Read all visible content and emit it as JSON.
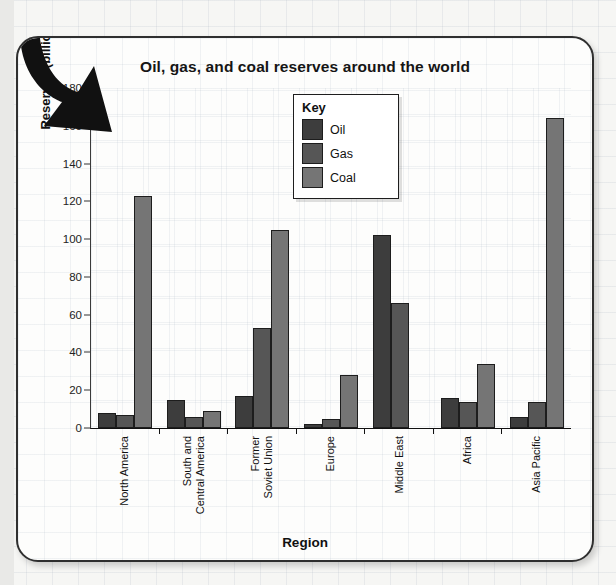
{
  "chart_data": {
    "type": "bar",
    "title": "Oil, gas, and coal reserves around the world",
    "xlabel": "Region",
    "ylabel": "Reserves (billions of tons of oil)",
    "ylim": [
      0,
      180
    ],
    "yticks": [
      0,
      20,
      40,
      60,
      80,
      100,
      120,
      140,
      160,
      180
    ],
    "grid": true,
    "legend_title": "Key",
    "legend_position": "inside-top-center",
    "categories": [
      "North America",
      "South and Central America",
      "Former Soviet Union",
      "Europe",
      "Middle East",
      "Africa",
      "Asia Pacific"
    ],
    "category_lines": [
      [
        "North America",
        ""
      ],
      [
        "South and",
        "Central America"
      ],
      [
        "Former",
        "Soviet Union"
      ],
      [
        "Europe",
        ""
      ],
      [
        "Middle East",
        ""
      ],
      [
        "Africa",
        ""
      ],
      [
        "Asia Pacific",
        ""
      ]
    ],
    "series": [
      {
        "name": "Oil",
        "color": "#3d3d3d",
        "values": [
          8,
          15,
          17,
          2,
          102,
          16,
          6
        ]
      },
      {
        "name": "Gas",
        "color": "#565656",
        "values": [
          7,
          6,
          53,
          5,
          66,
          14,
          14
        ]
      },
      {
        "name": "Coal",
        "color": "#757575",
        "values": [
          123,
          9,
          105,
          28,
          0,
          34,
          164
        ]
      }
    ]
  },
  "decorations": {
    "arrow": "down-left-arrow"
  }
}
